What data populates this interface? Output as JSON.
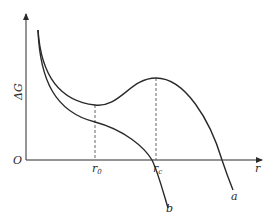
{
  "diagram": {
    "type": "free-energy-vs-radius",
    "colors": {
      "line": "#2a2a2a",
      "dashed": "#555555",
      "background": "#ffffff"
    },
    "axes": {
      "y_label": "ΔG",
      "x_label": "r",
      "origin_label": "O"
    },
    "markers": [
      {
        "name": "r0",
        "base": "r",
        "subscript": "0"
      },
      {
        "name": "rc",
        "base": "r",
        "subscript": "c"
      }
    ],
    "curves": [
      {
        "id": "a",
        "label": "a",
        "description": "has local minimum at r0 and maximum at rc, then falls below zero"
      },
      {
        "id": "b",
        "label": "b",
        "description": "monotonically decreasing, crosses axis near rc"
      }
    ]
  }
}
